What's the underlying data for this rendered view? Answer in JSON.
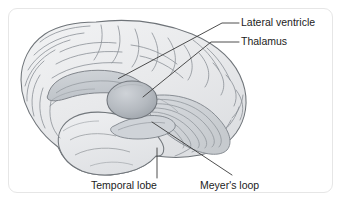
{
  "figure": {
    "background_color": "#ffffff",
    "border_color": "#e6e6e6",
    "line_color": "#3a3a3a",
    "outline_color": "#6e7277",
    "brain_fill": "#e9eaec",
    "structure_fill": "#c9cdd2",
    "thalamus_fill": "#b6babf"
  },
  "labels": [
    {
      "id": "lateral-ventricle",
      "text": "Lateral ventricle",
      "anchor_x": 241,
      "anchor_y": 26,
      "leader": "M118.5,78.5 L222,23 L239,23"
    },
    {
      "id": "thalamus",
      "text": "Thalamus",
      "anchor_x": 241,
      "anchor_y": 45,
      "leader": "M143,97 L211,42 L239,42"
    },
    {
      "id": "temporal-lobe",
      "text": "Temporal lobe",
      "anchor_x": 91,
      "anchor_y": 189,
      "leader": "M157,148 L157,178"
    },
    {
      "id": "meyers-loop",
      "text": "Meyer's loop",
      "anchor_x": 200,
      "anchor_y": 189,
      "leader": "M152,122 L232,175"
    }
  ],
  "structures": {
    "brain_outline_name": "cerebral-hemisphere",
    "lateral_ventricle_name": "lateral-ventricle-shape",
    "thalamus_name": "thalamus-shape",
    "optic_radiation_name": "optic-radiation-fibers",
    "temporal_lobe_name": "temporal-lobe-shape"
  }
}
